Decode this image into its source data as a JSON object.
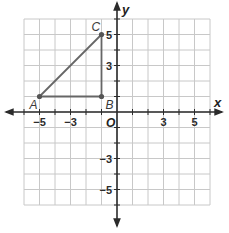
{
  "chart_data": {
    "type": "scatter",
    "title": "",
    "xlabel": "x",
    "ylabel": "y",
    "xlim": [
      -6,
      6
    ],
    "ylim": [
      -6,
      6
    ],
    "grid": true,
    "origin_label": "O",
    "x_tick_labels": [
      {
        "value": -5,
        "label": "−5"
      },
      {
        "value": -3,
        "label": "−3"
      },
      {
        "value": 3,
        "label": "3"
      },
      {
        "value": 5,
        "label": "5"
      }
    ],
    "y_tick_labels": [
      {
        "value": 5,
        "label": "5"
      },
      {
        "value": 3,
        "label": "3"
      },
      {
        "value": -3,
        "label": "−3"
      },
      {
        "value": -5,
        "label": "−5"
      }
    ],
    "points": [
      {
        "name": "A",
        "x": -5,
        "y": 1
      },
      {
        "name": "B",
        "x": -1,
        "y": 1
      },
      {
        "name": "C",
        "x": -1,
        "y": 5
      }
    ],
    "segments": [
      {
        "from": "A",
        "to": "B"
      },
      {
        "from": "B",
        "to": "C"
      },
      {
        "from": "A",
        "to": "C"
      }
    ],
    "colors": {
      "grid": "#c8c8c8",
      "axes": "#2b2b2b",
      "figure": "#666666",
      "point": "#555555"
    }
  }
}
